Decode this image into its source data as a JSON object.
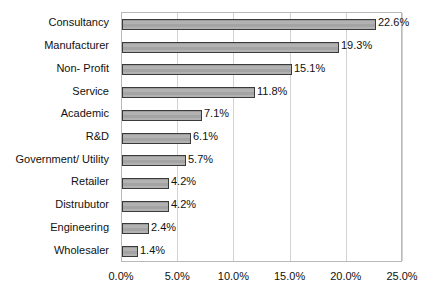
{
  "chart_data": {
    "type": "bar",
    "orientation": "horizontal",
    "title": "",
    "subtitle": "",
    "xlabel": "",
    "ylabel": "",
    "categories": [
      "Consultancy",
      "Manufacturer",
      "Non- Profit",
      "Service",
      "Academic",
      "R&D",
      "Government/ Utility",
      "Retailer",
      "Distrubutor",
      "Engineering",
      "Wholesaler"
    ],
    "values": [
      22.6,
      19.3,
      15.1,
      11.8,
      7.1,
      6.1,
      5.7,
      4.2,
      4.2,
      2.4,
      1.4
    ],
    "data_labels": [
      "22.6%",
      "19.3%",
      "15.1%",
      "11.8%",
      "7.1%",
      "6.1%",
      "5.7%",
      "4.2%",
      "4.2%",
      "2.4%",
      "1.4%"
    ],
    "xlim": [
      0,
      25
    ],
    "xtick_values": [
      0,
      5,
      10,
      15,
      20,
      25
    ],
    "xtick_labels": [
      "0.0%",
      "5.0%",
      "10.0%",
      "15.0%",
      "20.0%",
      "25.0%"
    ],
    "grid": true,
    "grid_axis": "x",
    "legend": false,
    "legend_position": "none",
    "colors": {
      "bar_fill": "#a9a9a9",
      "bar_border": "#3a3a3a",
      "gridline": "#d2d2d2",
      "frame": "#b9b9b9",
      "text": "#111111",
      "background": "#ffffff"
    }
  }
}
